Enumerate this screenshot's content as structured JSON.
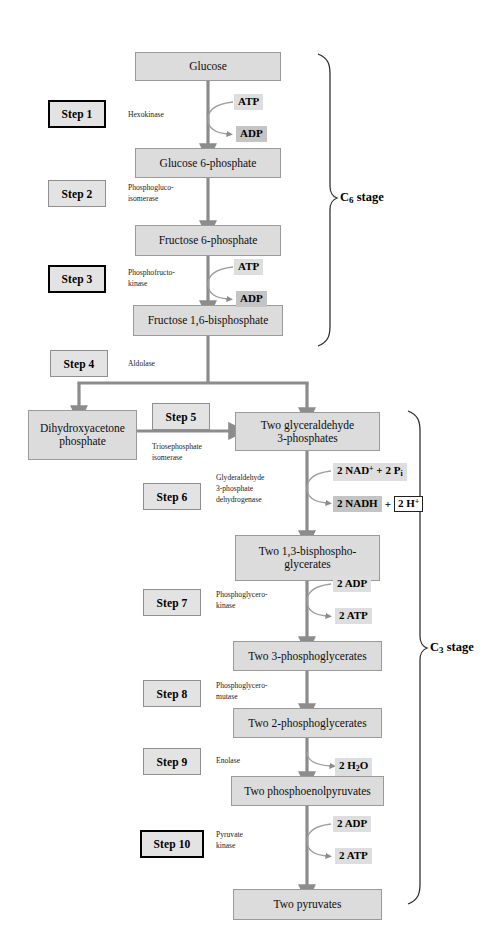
{
  "diagram": {
    "colors": {
      "metabolite_fill": "#dcdcdc",
      "metabolite_border": "#9a9a9a",
      "step_fill": "#e3e3e3",
      "step_border_thin": "#8f8f8f",
      "step_border_thick": "#000000",
      "cofactor_light": "#dedede",
      "cofactor_dark": "#c4c4c4",
      "arrow": "#8c8c8c",
      "background": "#ffffff"
    }
  },
  "metabolites": [
    {
      "id": "glucose",
      "label": "Glucose"
    },
    {
      "id": "g6p",
      "label": "Glucose 6-phosphate"
    },
    {
      "id": "f6p",
      "label": "Fructose 6-phosphate"
    },
    {
      "id": "f16bp",
      "label": "Fructose 1,6-bisphosphate"
    },
    {
      "id": "dhap",
      "label": "Dihydroxyacetone\nphosphate"
    },
    {
      "id": "g3p",
      "label": "Two glyceraldehyde\n3-phosphates"
    },
    {
      "id": "bpg",
      "label": "Two 1,3-bisphospho-\nglycerates"
    },
    {
      "id": "pg3",
      "label": "Two 3-phosphoglycerates"
    },
    {
      "id": "pg2",
      "label": "Two 2-phosphoglycerates"
    },
    {
      "id": "pep",
      "label": "Two phosphoenolpyruvates"
    },
    {
      "id": "pyruvate",
      "label": "Two pyruvates"
    }
  ],
  "steps": [
    {
      "id": "step1",
      "label": "Step 1",
      "emphasis": "thick"
    },
    {
      "id": "step2",
      "label": "Step 2",
      "emphasis": "thin"
    },
    {
      "id": "step3",
      "label": "Step 3",
      "emphasis": "thick"
    },
    {
      "id": "step4",
      "label": "Step 4",
      "emphasis": "thin"
    },
    {
      "id": "step5",
      "label": "Step 5",
      "emphasis": "thin"
    },
    {
      "id": "step6",
      "label": "Step 6",
      "emphasis": "thin"
    },
    {
      "id": "step7",
      "label": "Step 7",
      "emphasis": "thin"
    },
    {
      "id": "step8",
      "label": "Step 8",
      "emphasis": "thin"
    },
    {
      "id": "step9",
      "label": "Step 9",
      "emphasis": "thin"
    },
    {
      "id": "step10",
      "label": "Step 10",
      "emphasis": "thick"
    }
  ],
  "enzymes": [
    {
      "id": "enz1",
      "label": "Hexokinase"
    },
    {
      "id": "enz2",
      "label": "Phosphogluco-\nisomerase"
    },
    {
      "id": "enz3",
      "label": "Phosphofructo-\nkinase"
    },
    {
      "id": "enz4",
      "label": "Aldolase"
    },
    {
      "id": "enz5",
      "label": "Triosephosphate\nisomerase"
    },
    {
      "id": "enz6",
      "label": "Glyderaldehyde\n3-phosphate\ndehydrogenase"
    },
    {
      "id": "enz7",
      "label": "Phosphoglycero-\nkinase"
    },
    {
      "id": "enz8",
      "label": "Phosphoglycero-\nmutase"
    },
    {
      "id": "enz9",
      "label": "Enolase"
    },
    {
      "id": "enz10",
      "label": "Pyruvate\nkinase"
    }
  ],
  "cofactors": {
    "step1_in": "ATP",
    "step1_out": "ADP",
    "step3_in": "ATP",
    "step3_out": "ADP",
    "step6_in_count": "2",
    "step6_in_a": "NAD",
    "step6_in_sup": "+",
    "step6_in_plus": "+",
    "step6_in_b_count": "2",
    "step6_in_b": "P",
    "step6_in_b_sub": "i",
    "step6_out_nadh": "2 NADH",
    "step6_out_plus": "+",
    "step6_out_h_count": "2 H",
    "step6_out_h_sup": "+",
    "step7_in": "2 ADP",
    "step7_out": "2 ATP",
    "step9_out_count": "2 H",
    "step9_out_sub": "2",
    "step9_out_tail": "O",
    "step10_in": "2 ADP",
    "step10_out": "2 ATP"
  },
  "stages": [
    {
      "id": "c6",
      "prefix": "C",
      "subscript": "6",
      "suffix": " stage"
    },
    {
      "id": "c3",
      "prefix": "C",
      "subscript": "3",
      "suffix": " stage"
    }
  ]
}
